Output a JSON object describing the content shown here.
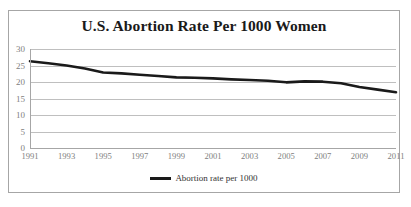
{
  "chart_data": {
    "type": "line",
    "title": "U.S. Abortion Rate Per 1000 Women",
    "xlabel": "",
    "ylabel": "",
    "ylim": [
      0,
      30
    ],
    "yticks": [
      0,
      5,
      10,
      15,
      20,
      25,
      30
    ],
    "xlim": [
      1991,
      2011
    ],
    "xticks": [
      1991,
      1993,
      1995,
      1997,
      1999,
      2001,
      2003,
      2005,
      2007,
      2009,
      2011
    ],
    "xtick_labels": [
      "1991",
      "1993",
      "1995",
      "1997",
      "1999",
      "2001",
      "2003",
      "2005",
      "2007",
      "2009",
      "2011"
    ],
    "ytick_labels": [
      "0",
      "5",
      "10",
      "15",
      "20",
      "25",
      "30"
    ],
    "grid": true,
    "legend_position": "bottom",
    "x": [
      1991,
      1992,
      1993,
      1994,
      1995,
      1996,
      1997,
      1998,
      1999,
      2000,
      2001,
      2002,
      2003,
      2004,
      2005,
      2006,
      2007,
      2008,
      2009,
      2010,
      2011
    ],
    "series": [
      {
        "name": "Abortion rate per 1000",
        "color": "#1a1a1a",
        "values": [
          26.3,
          25.7,
          25.0,
          24.1,
          22.9,
          22.6,
          22.2,
          21.8,
          21.4,
          21.3,
          21.1,
          20.8,
          20.6,
          20.4,
          19.9,
          20.2,
          20.1,
          19.6,
          18.5,
          17.7,
          16.9
        ]
      }
    ]
  },
  "legend": {
    "entries": [
      {
        "label": "Abortion rate per 1000"
      }
    ]
  }
}
